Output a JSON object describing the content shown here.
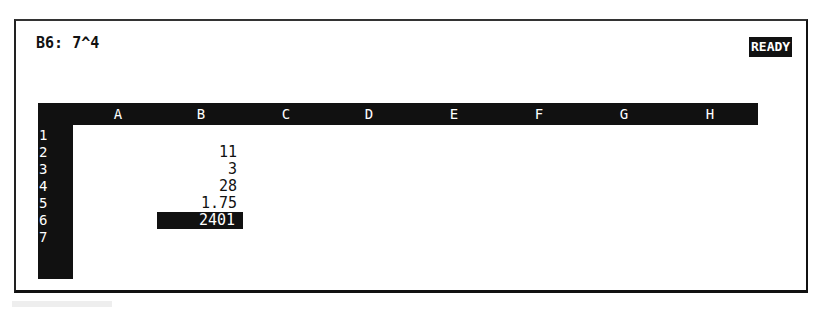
{
  "control_panel": {
    "cell_address": "B6:",
    "cell_contents": "7^4",
    "mode_indicator": "READY"
  },
  "columns": [
    "A",
    "B",
    "C",
    "D",
    "E",
    "F",
    "G",
    "H"
  ],
  "rows": [
    "1",
    "2",
    "3",
    "4",
    "5",
    "6",
    "7"
  ],
  "cells": {
    "B2": "11",
    "B3": "3",
    "B4": "28",
    "B5": "1.75",
    "B6": "2401"
  },
  "selected_cell": "B6",
  "colors": {
    "header_background": "#111111",
    "header_text": "#ffffff",
    "background": "#ffffff"
  }
}
